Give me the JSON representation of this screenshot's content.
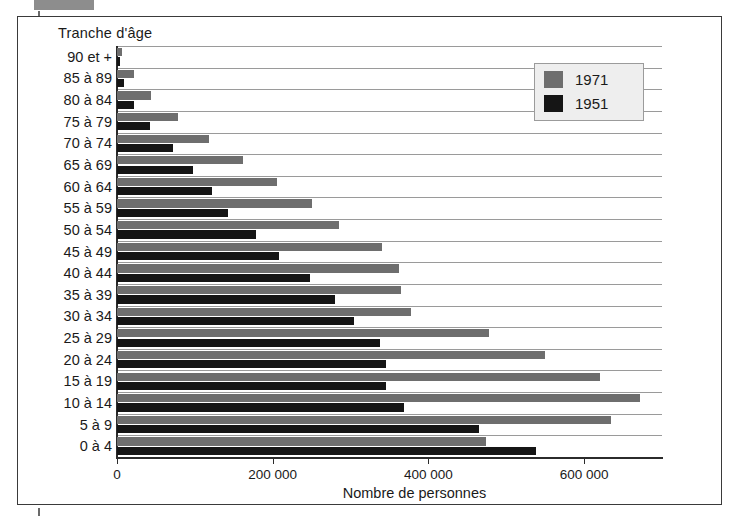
{
  "redaction": {
    "name": "redacted-label-bar"
  },
  "chart_data": {
    "type": "bar",
    "orientation": "horizontal",
    "title": "",
    "xlabel": "Nombre de personnes",
    "ylabel": "Tranche d'âge",
    "categories": [
      "90 et +",
      "85 à 89",
      "80 à 84",
      "75 à 79",
      "70 à 74",
      "65 à 69",
      "60 à 64",
      "55 à 59",
      "50 à 54",
      "45 à 49",
      "40 à 44",
      "35 à 39",
      "30 à 34",
      "25 à 29",
      "20 à 24",
      "15 à 19",
      "10 à 14",
      "5 à 9",
      "0 à 4"
    ],
    "series": [
      {
        "name": "1971",
        "color": "#6e6e6e",
        "values": [
          7000,
          22000,
          44000,
          78000,
          118000,
          162000,
          205000,
          250000,
          285000,
          340000,
          362000,
          365000,
          378000,
          478000,
          550000,
          620000,
          672000,
          635000,
          474000
        ]
      },
      {
        "name": "1951",
        "color": "#151515",
        "values": [
          4000,
          9000,
          22000,
          42000,
          72000,
          98000,
          122000,
          143000,
          178000,
          208000,
          248000,
          280000,
          305000,
          338000,
          345000,
          345000,
          368000,
          465000,
          538000
        ]
      }
    ],
    "xlim": [
      0,
      700000
    ],
    "xticks": [
      0,
      200000,
      400000,
      600000
    ],
    "xtick_labels": [
      "0",
      "200 000",
      "400 000",
      "600 000"
    ],
    "grid": true,
    "grid_axis": "y",
    "legend_position": "top-right",
    "legend_entries": [
      "1971",
      "1951"
    ]
  }
}
